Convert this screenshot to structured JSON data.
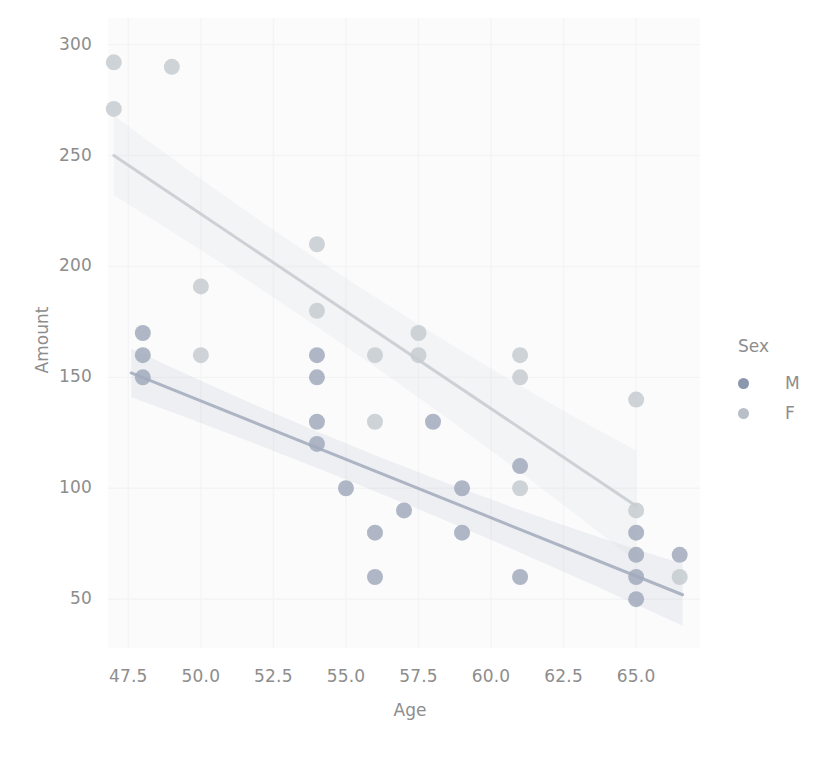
{
  "chart_data": {
    "type": "scatter",
    "title": "",
    "xlabel": "Age",
    "ylabel": "Amount",
    "xlim": [
      46.8,
      67.2
    ],
    "ylim": [
      28,
      312
    ],
    "xticks": [
      "47.5",
      "50.0",
      "52.5",
      "55.0",
      "57.5",
      "60.0",
      "62.5",
      "65.0"
    ],
    "xtick_values": [
      47.5,
      50.0,
      52.5,
      55.0,
      57.5,
      60.0,
      62.5,
      65.0
    ],
    "yticks": [
      "50",
      "100",
      "150",
      "200",
      "250",
      "300"
    ],
    "ytick_values": [
      50,
      100,
      150,
      200,
      250,
      300
    ],
    "grid": true,
    "legend": {
      "title": "Sex",
      "position": "right",
      "entries": [
        {
          "label": "M",
          "color": "#8b97ad"
        },
        {
          "label": "F",
          "color": "#b9bfc6"
        }
      ]
    },
    "series": [
      {
        "name": "M",
        "color": "#8b97ad",
        "marker": "circle",
        "points": [
          [
            48,
            170
          ],
          [
            48,
            160
          ],
          [
            48,
            150
          ],
          [
            54,
            160
          ],
          [
            54,
            150
          ],
          [
            54,
            130
          ],
          [
            54,
            120
          ],
          [
            55,
            100
          ],
          [
            56,
            80
          ],
          [
            56,
            60
          ],
          [
            57,
            90
          ],
          [
            58,
            130
          ],
          [
            59,
            100
          ],
          [
            59,
            80
          ],
          [
            61,
            110
          ],
          [
            61,
            60
          ],
          [
            65,
            80
          ],
          [
            65,
            70
          ],
          [
            65,
            60
          ],
          [
            65,
            50
          ],
          [
            66.5,
            70
          ]
        ],
        "regression": {
          "x_start": 47.6,
          "y_start": 152,
          "x_end": 66.6,
          "y_end": 52
        },
        "ci_band": {
          "x_start": 47.6,
          "x_end": 66.6,
          "upper_start": 163,
          "lower_start": 141,
          "upper_mid": 104,
          "lower_mid": 96,
          "upper_end": 66,
          "lower_end": 38
        }
      },
      {
        "name": "F",
        "color": "#b9bfc6",
        "marker": "circle",
        "points": [
          [
            47,
            292
          ],
          [
            47,
            271
          ],
          [
            49,
            290
          ],
          [
            50,
            191
          ],
          [
            50,
            160
          ],
          [
            54,
            210
          ],
          [
            54,
            180
          ],
          [
            56,
            160
          ],
          [
            56,
            130
          ],
          [
            57.5,
            170
          ],
          [
            57.5,
            160
          ],
          [
            61,
            160
          ],
          [
            61,
            150
          ],
          [
            61,
            100
          ],
          [
            65,
            140
          ],
          [
            65,
            90
          ],
          [
            66.5,
            60
          ]
        ],
        "regression": {
          "x_start": 47.0,
          "y_start": 250,
          "x_end": 65.0,
          "y_end": 92
        },
        "ci_band": {
          "x_start": 47.0,
          "x_end": 65.0,
          "upper_start": 268,
          "lower_start": 232,
          "upper_mid": 180,
          "lower_mid": 160,
          "upper_end": 117,
          "lower_end": 67
        }
      }
    ]
  }
}
